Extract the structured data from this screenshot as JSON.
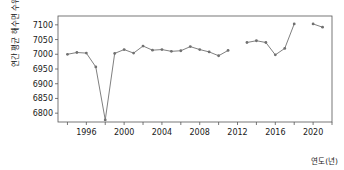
{
  "chart_data": {
    "type": "line",
    "title": "",
    "subtitle": "",
    "xlabel": "연도(년)",
    "ylabel": "연간 평균 해수면 수위(mm)",
    "xlim": [
      1993,
      2022
    ],
    "ylim": [
      6770,
      7130
    ],
    "xticks": [
      1996,
      2000,
      2004,
      2008,
      2012,
      2016,
      2020
    ],
    "xtick_labels": [
      "1996",
      "2000",
      "2004",
      "2008",
      "2012",
      "2016",
      "2020"
    ],
    "minor_xtick_step": 2,
    "yticks": [
      6800,
      6850,
      6900,
      6950,
      7000,
      7050,
      7100
    ],
    "ytick_labels": [
      "6800",
      "6850",
      "6900",
      "6950",
      "7000",
      "7050",
      "7100"
    ],
    "grid": false,
    "legend": false,
    "legend_position": "none",
    "line_color": "#808080",
    "marker_color": "#707070",
    "marker": "circle",
    "series": [
      {
        "name": "연간 평균 해수면 수위",
        "x": [
          1994,
          1995,
          1996,
          1997,
          1998,
          1999,
          2000,
          2001,
          2002,
          2003,
          2004,
          2005,
          2006,
          2007,
          2008,
          2009,
          2010,
          2011,
          2013,
          2014,
          2015,
          2016,
          2017,
          2018,
          2020,
          2021
        ],
        "values": [
          7000,
          7006,
          7004,
          6957,
          6777,
          7003,
          7016,
          7004,
          7028,
          7014,
          7016,
          7010,
          7012,
          7026,
          7016,
          7008,
          6995,
          7013,
          7040,
          7046,
          7040,
          6998,
          7020,
          7103,
          7103,
          7092
        ]
      }
    ],
    "breaks": [
      [
        2011,
        2013
      ],
      [
        2018,
        2020
      ]
    ]
  },
  "axes": {
    "y_title": "연간 평균 해수면 수위(mm)",
    "x_title": "연도(년)"
  }
}
